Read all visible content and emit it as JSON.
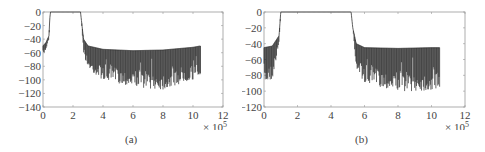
{
  "chart_data": [
    {
      "type": "line",
      "panel": "(a)",
      "title": "",
      "xlabel": "",
      "ylabel": "",
      "x_exponent_label": "× 10^5",
      "xlim": [
        0,
        12
      ],
      "ylim": [
        -140,
        0
      ],
      "xticks": [
        0,
        2,
        4,
        6,
        8,
        10,
        12
      ],
      "yticks": [
        0,
        -20,
        -40,
        -60,
        -80,
        -100,
        -120,
        -140
      ],
      "grid": false,
      "legend": null,
      "series": [
        {
          "name": "magnitude response (dB)",
          "description": "Passband 0 dB from ~0.5 to ~2.5 (×10^5); stopbands ripple between ~-50 and ~-120 dB; data ends at ~10.5",
          "x": [
            0,
            0.2,
            0.4,
            0.45,
            0.5,
            2.5,
            2.55,
            2.7,
            3.0,
            4.0,
            6.0,
            8.0,
            10.0,
            10.5
          ],
          "upper_envelope": [
            -50,
            -45,
            -35,
            -10,
            0,
            0,
            -10,
            -40,
            -50,
            -55,
            -57,
            -56,
            -52,
            -50
          ],
          "lower_envelope": [
            -65,
            -55,
            -40,
            -10,
            0,
            0,
            -10,
            -60,
            -85,
            -100,
            -110,
            -115,
            -100,
            -95
          ]
        }
      ]
    },
    {
      "type": "line",
      "panel": "(b)",
      "title": "",
      "xlabel": "",
      "ylabel": "",
      "x_exponent_label": "× 10^5",
      "xlim": [
        0,
        12
      ],
      "ylim": [
        -120,
        0
      ],
      "xticks": [
        0,
        2,
        4,
        6,
        8,
        10,
        12
      ],
      "yticks": [
        0,
        -20,
        -40,
        -60,
        -80,
        -100,
        -120
      ],
      "grid": false,
      "legend": null,
      "series": [
        {
          "name": "magnitude response (dB)",
          "description": "Passband 0 dB from ~1.0 to ~5.2 (×10^5); stopbands ripple between ~-45 and ~-105 dB; data ends at ~10.5",
          "x": [
            0,
            0.5,
            0.9,
            1.0,
            5.2,
            5.3,
            5.5,
            6.0,
            8.0,
            10.0,
            10.5
          ],
          "upper_envelope": [
            -45,
            -43,
            -30,
            0,
            0,
            -20,
            -40,
            -45,
            -46,
            -45,
            -45
          ],
          "lower_envelope": [
            -90,
            -85,
            -40,
            0,
            0,
            -20,
            -70,
            -90,
            -100,
            -100,
            -95
          ]
        }
      ]
    }
  ],
  "captions": {
    "a": "(a)",
    "b": "(b)"
  },
  "exponent": {
    "times": "× 10",
    "power": "5"
  }
}
